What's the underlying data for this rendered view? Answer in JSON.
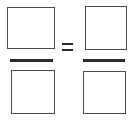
{
  "canvas": {
    "width": 135,
    "height": 120,
    "background_color": "#ffffff"
  },
  "colors": {
    "box_border": "#4a4a4a",
    "box_fill": "#ffffff",
    "bar": "#2b2b2b",
    "equals": "#2b2b2b"
  },
  "equation": {
    "description": "Two empty fractions joined by an equals sign",
    "relation_symbol": "=",
    "left_fraction": {
      "numerator": {
        "label": "",
        "kind": "empty-box",
        "x": 7,
        "y": 7,
        "width": 48,
        "height": 42
      },
      "bar": {
        "x": 10,
        "y": 59,
        "width": 43,
        "height": 3
      },
      "denominator": {
        "label": "",
        "kind": "empty-box",
        "x": 11,
        "y": 70,
        "width": 44,
        "height": 44
      }
    },
    "equals": {
      "x": 62,
      "y": 43,
      "width": 11,
      "height": 8,
      "stroke_height": 2
    },
    "right_fraction": {
      "numerator": {
        "label": "",
        "kind": "empty-box",
        "x": 85,
        "y": 6,
        "width": 42,
        "height": 44
      },
      "bar": {
        "x": 83,
        "y": 59,
        "width": 42,
        "height": 3
      },
      "denominator": {
        "label": "",
        "kind": "empty-box",
        "x": 83,
        "y": 71,
        "width": 43,
        "height": 43
      }
    }
  }
}
